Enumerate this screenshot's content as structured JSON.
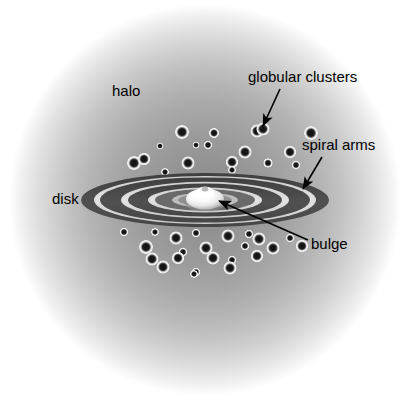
{
  "figure": {
    "background_color": "#ffffff",
    "width": 407,
    "height": 401
  },
  "labels": [
    {
      "id": "halo",
      "text": "halo",
      "x": 112,
      "y": 83,
      "font_size": 15,
      "color": "#000000"
    },
    {
      "id": "globular-clusters",
      "text": "globular clusters",
      "x": 248,
      "y": 69,
      "font_size": 15,
      "color": "#000000"
    },
    {
      "id": "spiral-arms",
      "text": "spiral arms",
      "x": 302,
      "y": 137,
      "font_size": 15,
      "color": "#000000"
    },
    {
      "id": "disk",
      "text": "disk",
      "x": 52,
      "y": 191,
      "font_size": 15,
      "color": "#000000"
    },
    {
      "id": "bulge",
      "text": "bulge",
      "x": 311,
      "y": 236,
      "font_size": 15,
      "color": "#000000"
    }
  ],
  "leader_lines": [
    {
      "id": "globular-clusters-arrow",
      "from_x": 280,
      "from_y": 89,
      "to_x": 263,
      "to_y": 126,
      "color": "#000000"
    },
    {
      "id": "spiral-arms-arrow",
      "from_x": 322,
      "from_y": 157,
      "to_x": 303,
      "to_y": 189,
      "color": "#000000"
    },
    {
      "id": "bulge-arrow",
      "from_x": 308,
      "from_y": 240,
      "to_x": 219,
      "to_y": 201,
      "color": "#000000"
    }
  ],
  "halo": {
    "center_x": 205,
    "center_y": 200,
    "radius": 196,
    "inner_color": "#8e8e8e",
    "outer_color": "#ffffff"
  },
  "disk": {
    "center_x": 205,
    "center_y": 200,
    "outer_rx": 124,
    "outer_ry": 27,
    "dark_color": "#4d4d4d",
    "light_color": "#d9d9d9",
    "ring_count": 5
  },
  "bulge": {
    "center_x": 205,
    "center_y": 198,
    "rx": 18,
    "ry": 10,
    "color": "#ffffff",
    "shadow_color": "#9a9a9a"
  },
  "globular_clusters": {
    "core_color": "#141414",
    "ring_color": "#e6e6e6",
    "points": [
      {
        "x": 182,
        "y": 132,
        "r": 3.6
      },
      {
        "x": 214,
        "y": 133,
        "r": 2.6
      },
      {
        "x": 257,
        "y": 131,
        "r": 3.4
      },
      {
        "x": 311,
        "y": 133,
        "r": 3.6
      },
      {
        "x": 263,
        "y": 129,
        "r": 3.4
      },
      {
        "x": 160,
        "y": 146,
        "r": 1.8
      },
      {
        "x": 196,
        "y": 145,
        "r": 1.8
      },
      {
        "x": 208,
        "y": 145,
        "r": 2.2
      },
      {
        "x": 245,
        "y": 152,
        "r": 3.4
      },
      {
        "x": 290,
        "y": 152,
        "r": 3.2
      },
      {
        "x": 134,
        "y": 163,
        "r": 3.6
      },
      {
        "x": 188,
        "y": 163,
        "r": 3.4
      },
      {
        "x": 144,
        "y": 159,
        "r": 3.2
      },
      {
        "x": 232,
        "y": 162,
        "r": 3.2
      },
      {
        "x": 268,
        "y": 163,
        "r": 2.4
      },
      {
        "x": 232,
        "y": 170,
        "r": 2.0
      },
      {
        "x": 165,
        "y": 172,
        "r": 2.0
      },
      {
        "x": 296,
        "y": 165,
        "r": 2.2
      },
      {
        "x": 124,
        "y": 232,
        "r": 2.2
      },
      {
        "x": 155,
        "y": 232,
        "r": 2.0
      },
      {
        "x": 176,
        "y": 238,
        "r": 3.4
      },
      {
        "x": 196,
        "y": 233,
        "r": 2.2
      },
      {
        "x": 228,
        "y": 236,
        "r": 3.4
      },
      {
        "x": 249,
        "y": 234,
        "r": 2.2
      },
      {
        "x": 259,
        "y": 239,
        "r": 3.4
      },
      {
        "x": 290,
        "y": 238,
        "r": 2.2
      },
      {
        "x": 146,
        "y": 247,
        "r": 3.6
      },
      {
        "x": 183,
        "y": 252,
        "r": 2.2
      },
      {
        "x": 206,
        "y": 248,
        "r": 3.4
      },
      {
        "x": 245,
        "y": 246,
        "r": 2.2
      },
      {
        "x": 273,
        "y": 248,
        "r": 3.4
      },
      {
        "x": 302,
        "y": 246,
        "r": 3.2
      },
      {
        "x": 152,
        "y": 259,
        "r": 3.4
      },
      {
        "x": 178,
        "y": 258,
        "r": 3.2
      },
      {
        "x": 213,
        "y": 258,
        "r": 3.4
      },
      {
        "x": 232,
        "y": 260,
        "r": 2.2
      },
      {
        "x": 257,
        "y": 256,
        "r": 3.2
      },
      {
        "x": 163,
        "y": 267,
        "r": 3.4
      },
      {
        "x": 196,
        "y": 272,
        "r": 2.2
      },
      {
        "x": 230,
        "y": 268,
        "r": 3.4
      },
      {
        "x": 194,
        "y": 274,
        "r": 2.0
      }
    ]
  }
}
